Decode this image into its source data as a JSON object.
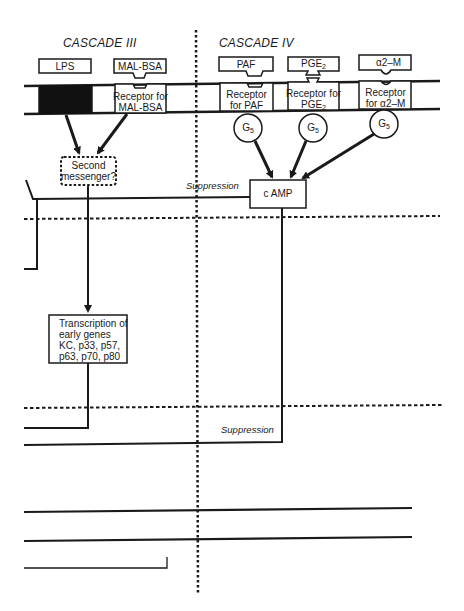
{
  "cascades": [
    {
      "title": "CASCADE III",
      "ligands": [
        {
          "label": "LPS"
        },
        {
          "label": "MAL-BSA"
        }
      ],
      "receptors": [
        {
          "label": "",
          "filled": true
        },
        {
          "label_line1": "Receptor for",
          "label_line2": "MAL-BSA"
        }
      ]
    },
    {
      "title": "CASCADE IV",
      "ligands": [
        {
          "label": "PAF"
        },
        {
          "label_main": "PGE",
          "label_sub": "2"
        },
        {
          "label": "α2–M"
        }
      ],
      "receptors": [
        {
          "label_line1": "Receptor",
          "label_line2": "for PAF"
        },
        {
          "label_line1": "Receptor for",
          "label_line2_main": "PGE",
          "label_line2_sub": "2"
        },
        {
          "label_line1": "Receptor",
          "label_line2": "for α2–M"
        }
      ],
      "g_proteins": [
        {
          "main": "G",
          "sub": "5"
        },
        {
          "main": "G",
          "sub": "5"
        },
        {
          "main": "G",
          "sub": "5"
        }
      ]
    }
  ],
  "nodes": {
    "second_messenger": {
      "line1": "Second",
      "line2": "messenger?"
    },
    "camp": {
      "label": "c AMP"
    },
    "transcription": {
      "lines": [
        "Transcription of",
        "early genes",
        "KC, p33, p57,",
        "p63, p70, p80"
      ]
    }
  },
  "annotations": {
    "suppression_upper": "Suppression",
    "suppression_lower": "Suppression"
  },
  "colors": {
    "ink": "#1a1a1a",
    "background": "#ffffff"
  }
}
